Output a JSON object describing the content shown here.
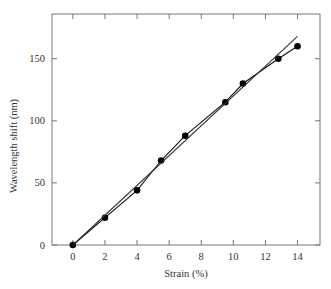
{
  "chart_data": {
    "type": "line",
    "title": "",
    "xlabel": "Strain (%)",
    "ylabel": "Wavelength shift (nm)",
    "xlim": [
      -1.3,
      15.4
    ],
    "ylim": [
      0,
      186
    ],
    "xticks": [
      0,
      2,
      4,
      6,
      8,
      10,
      12,
      14
    ],
    "yticks": [
      0,
      50,
      100,
      150
    ],
    "grid": false,
    "legend": null,
    "series": [
      {
        "name": "Measured",
        "style": "line-with-markers",
        "marker": "filled-circle",
        "color": "#111111",
        "x": [
          0,
          2,
          4,
          5.5,
          7,
          9.5,
          10.6,
          12.8,
          14
        ],
        "y": [
          0,
          22,
          44,
          68,
          88,
          115,
          130,
          150,
          160
        ]
      },
      {
        "name": "Linear fit",
        "style": "line",
        "color": "#333333",
        "x": [
          0,
          14
        ],
        "y": [
          0,
          168
        ]
      }
    ]
  }
}
